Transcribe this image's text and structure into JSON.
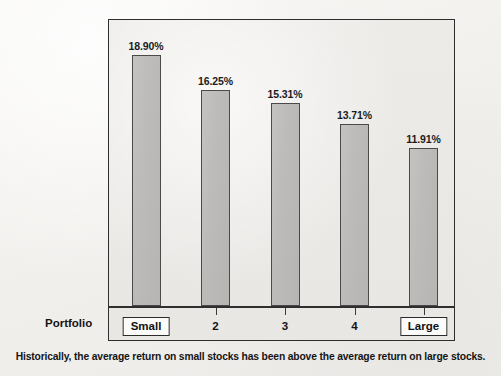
{
  "figure": {
    "portfolio_row_label": "Portfolio",
    "caption": "Historically, the average return on small stocks has been above the average return on large stocks.",
    "frame_border_color": "#2e2e2e",
    "page_background": "#f4f3f1",
    "plot_background": "#ebe9e6"
  },
  "chart_data": {
    "type": "bar",
    "title": "",
    "xlabel": "Portfolio",
    "ylabel": "",
    "categories": [
      "Small",
      "2",
      "3",
      "4",
      "Large"
    ],
    "values": [
      18.9,
      16.25,
      15.31,
      13.71,
      11.91
    ],
    "data_labels": [
      "18.90%",
      "16.25%",
      "15.31%",
      "13.71%",
      "11.91%"
    ],
    "ylim": [
      0,
      20.2
    ],
    "grid": false,
    "legend": null,
    "bar_fill_color": "#bdbcba",
    "bar_border_color": "#4a4a4a",
    "axis_ticks_visible": true,
    "boxed_categories": [
      "Small",
      "Large"
    ]
  }
}
